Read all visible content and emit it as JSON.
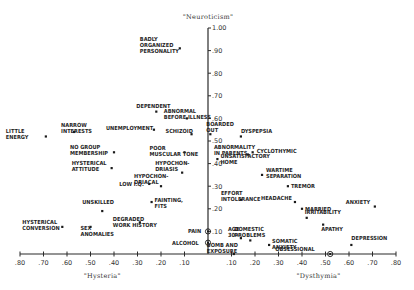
{
  "chart_data": {
    "type": "scatter",
    "title": "",
    "ylabel": "\"Neuroticism\"",
    "xlabel_left": "\"Hysteria\"",
    "xlabel_right": "\"Dysthymia\"",
    "xlim": [
      -0.8,
      0.8
    ],
    "ylim": [
      0,
      1.0
    ],
    "grid": false,
    "legend": null,
    "x_tick_labels": [
      ".80",
      ".70",
      ".60",
      ".50",
      ".40",
      ".30",
      ".20",
      ".10",
      ".10",
      ".20",
      ".30",
      ".40",
      ".50",
      ".60",
      ".70",
      ".80"
    ],
    "y_tick_labels": [
      ".10",
      ".20",
      ".30",
      ".40",
      ".50",
      ".60",
      ".70",
      ".80",
      ".90",
      "1.00"
    ],
    "note": "Negative x = Hysteria direction (left), positive x = Dysthymia direction (right)",
    "points": [
      {
        "label": [
          "BADLY",
          "ORGANIZED",
          "PERSONALITY"
        ],
        "x": -0.12,
        "y": 0.91
      },
      {
        "label": [
          "DEPENDENT"
        ],
        "x": -0.22,
        "y": 0.63
      },
      {
        "label": [
          "ABNORMAL",
          "BEFORE ILLNESS"
        ],
        "x": -0.09,
        "y": 0.6
      },
      {
        "label": [
          "UNEMPLOYMENT"
        ],
        "x": -0.23,
        "y": 0.55
      },
      {
        "label": [
          "SCHIZOID"
        ],
        "x": -0.07,
        "y": 0.53
      },
      {
        "label": [
          "LITTLE",
          "ENERGY"
        ],
        "x": -0.69,
        "y": 0.52
      },
      {
        "label": [
          "NARROW",
          "INTERESTS"
        ],
        "x": -0.57,
        "y": 0.54
      },
      {
        "label": [
          "NO GROUP",
          "MEMBERSHIP"
        ],
        "x": -0.4,
        "y": 0.45
      },
      {
        "label": [
          "POOR",
          "MUSCULAR TONE"
        ],
        "x": -0.1,
        "y": 0.45
      },
      {
        "label": [
          "HYPOCHON-",
          "DRIASIS"
        ],
        "x": -0.11,
        "y": 0.36
      },
      {
        "label": [
          "HYSTERICAL",
          "ATTITUDE"
        ],
        "x": -0.41,
        "y": 0.38
      },
      {
        "label": [
          "LOW I.Q."
        ],
        "x": -0.25,
        "y": 0.31
      },
      {
        "label": [
          "HYPOCHON-",
          "DRIACAL"
        ],
        "x": -0.2,
        "y": 0.3
      },
      {
        "label": [
          "FAINTING,",
          "FITS"
        ],
        "x": -0.24,
        "y": 0.23
      },
      {
        "label": [
          "UNSKILLED"
        ],
        "x": -0.45,
        "y": 0.19
      },
      {
        "label": [
          "HYSTERICAL",
          "CONVERSION"
        ],
        "x": -0.62,
        "y": 0.12
      },
      {
        "label": [
          "SEX",
          "ANOMALIES"
        ],
        "x": -0.5,
        "y": 0.12
      },
      {
        "label": [
          "DEGRADED",
          "WORK HISTORY"
        ],
        "x": -0.29,
        "y": 0.14
      },
      {
        "label": [
          "PAIN"
        ],
        "x": 0.0,
        "y": 0.1,
        "marker": "circle"
      },
      {
        "label": [
          "ALCOHOL"
        ],
        "x": 0.0,
        "y": 0.05,
        "marker": "circle"
      },
      {
        "label": [
          "BOARDED",
          "OUT"
        ],
        "x": 0.01,
        "y": 0.53
      },
      {
        "label": [
          "DYSPEPSIA"
        ],
        "x": 0.14,
        "y": 0.52
      },
      {
        "label": [
          "ABNORMALITY",
          "IN PARENTS"
        ],
        "x": 0.17,
        "y": 0.44
      },
      {
        "label": [
          "CYCLOTHYMIC"
        ],
        "x": 0.19,
        "y": 0.45
      },
      {
        "label": [
          "UNSATISFACTORY",
          "HOME"
        ],
        "x": 0.04,
        "y": 0.42
      },
      {
        "label": [
          "WARTIME",
          "SEPARATION"
        ],
        "x": 0.23,
        "y": 0.35
      },
      {
        "label": [
          "TREMOR"
        ],
        "x": 0.34,
        "y": 0.3
      },
      {
        "label": [
          "EFFORT",
          "INTOLERANCE"
        ],
        "x": 0.14,
        "y": 0.24
      },
      {
        "label": [
          "HEADACHE"
        ],
        "x": 0.37,
        "y": 0.23
      },
      {
        "label": [
          "MARRIED"
        ],
        "x": 0.4,
        "y": 0.2
      },
      {
        "label": [
          "IRRITABILITY"
        ],
        "x": 0.42,
        "y": 0.16
      },
      {
        "label": [
          "ANXIETY"
        ],
        "x": 0.71,
        "y": 0.21
      },
      {
        "label": [
          "APATHY"
        ],
        "x": 0.49,
        "y": 0.13
      },
      {
        "label": [
          "AGE",
          "30+"
        ],
        "x": 0.14,
        "y": 0.07
      },
      {
        "label": [
          "DOMESTIC",
          "PROBLEMS"
        ],
        "x": 0.18,
        "y": 0.06
      },
      {
        "label": [
          "SOMATIC",
          "ANXIETY"
        ],
        "x": 0.26,
        "y": 0.04
      },
      {
        "label": [
          "BOMB AND",
          "EXPOSURE"
        ],
        "x": 0.11,
        "y": 0.0
      },
      {
        "label": [
          "OBSESSIONAL"
        ],
        "x": 0.52,
        "y": 0.0,
        "marker": "circle"
      },
      {
        "label": [
          "DEPRESSION"
        ],
        "x": 0.61,
        "y": 0.04
      }
    ]
  }
}
